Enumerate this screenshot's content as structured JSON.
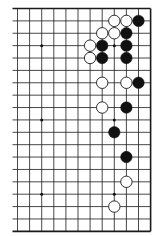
{
  "diagram": {
    "type": "go-board-fragment",
    "colors": {
      "background": "#ffffff",
      "line": "#1a1a1a",
      "black_stone": "#111111",
      "white_stone": "#ffffff",
      "white_stone_outline": "#1a1a1a",
      "star_point": "#111111"
    },
    "grid": {
      "columns": 12,
      "rows": 19,
      "col_x_start": 17.5,
      "col_spacing": 12.1,
      "row_y_start": 8.5,
      "row_spacing": 12.38,
      "left_overhang": 5,
      "edges": {
        "top": true,
        "right": true,
        "bottom": true,
        "left": false
      }
    },
    "star_points": [
      {
        "col": 2,
        "row": 3
      },
      {
        "col": 8,
        "row": 3
      },
      {
        "col": 2,
        "row": 9
      },
      {
        "col": 8,
        "row": 9
      },
      {
        "col": 2,
        "row": 15
      },
      {
        "col": 8,
        "row": 15
      }
    ],
    "stones": [
      {
        "color": "white",
        "col": 8,
        "row": 1
      },
      {
        "color": "white",
        "col": 9,
        "row": 1
      },
      {
        "color": "black",
        "col": 10,
        "row": 1
      },
      {
        "color": "white",
        "col": 7,
        "row": 2
      },
      {
        "color": "white",
        "col": 8,
        "row": 2
      },
      {
        "color": "black",
        "col": 9,
        "row": 2
      },
      {
        "color": "white",
        "col": 6,
        "row": 3
      },
      {
        "color": "black",
        "col": 7,
        "row": 3
      },
      {
        "color": "black",
        "col": 9,
        "row": 3
      },
      {
        "color": "white",
        "col": 6,
        "row": 4
      },
      {
        "color": "black",
        "col": 7,
        "row": 4
      },
      {
        "color": "black",
        "col": 9,
        "row": 4
      },
      {
        "color": "white",
        "col": 7,
        "row": 6
      },
      {
        "color": "white",
        "col": 9,
        "row": 6
      },
      {
        "color": "black",
        "col": 10,
        "row": 6
      },
      {
        "color": "white",
        "col": 7,
        "row": 8
      },
      {
        "color": "black",
        "col": 9,
        "row": 8
      },
      {
        "color": "black",
        "col": 8,
        "row": 10
      },
      {
        "color": "black",
        "col": 9,
        "row": 12
      },
      {
        "color": "white",
        "col": 9,
        "row": 14
      },
      {
        "color": "white",
        "col": 8,
        "row": 16
      }
    ],
    "stone_radius": 5.7,
    "star_radius": 1.5
  }
}
